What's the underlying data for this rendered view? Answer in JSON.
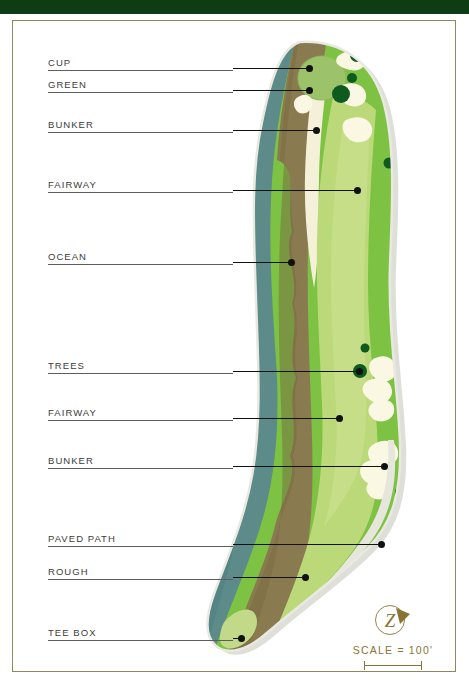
{
  "document": {
    "type": "golf-hole-plan-diagram",
    "header_band_color": "#0e3d13",
    "frame_border_color": "#8a8a5e",
    "background_color": "#ffffff"
  },
  "callouts": [
    {
      "label": "CUP",
      "rule_width": 185,
      "x": 48,
      "y": 68,
      "leader_x": 233,
      "leader_end": 310,
      "leader_y": 68
    },
    {
      "label": "GREEN",
      "rule_width": 185,
      "x": 48,
      "y": 90,
      "leader_x": 233,
      "leader_end": 310,
      "leader_y": 90
    },
    {
      "label": "BUNKER",
      "rule_width": 185,
      "x": 48,
      "y": 130,
      "leader_x": 233,
      "leader_end": 317,
      "leader_y": 130
    },
    {
      "label": "FAIRWAY",
      "rule_width": 185,
      "x": 48,
      "y": 190,
      "leader_x": 233,
      "leader_end": 358,
      "leader_y": 190
    },
    {
      "label": "OCEAN",
      "rule_width": 185,
      "x": 48,
      "y": 262,
      "leader_x": 233,
      "leader_end": 292,
      "leader_y": 262
    },
    {
      "label": "TREES",
      "rule_width": 185,
      "x": 48,
      "y": 371,
      "leader_x": 233,
      "leader_end": 360,
      "leader_y": 371
    },
    {
      "label": "FAIRWAY",
      "rule_width": 185,
      "x": 48,
      "y": 418,
      "leader_x": 233,
      "leader_end": 340,
      "leader_y": 418
    },
    {
      "label": "BUNKER",
      "rule_width": 185,
      "x": 48,
      "y": 466,
      "leader_x": 233,
      "leader_end": 385,
      "leader_y": 466
    },
    {
      "label": "PAVED PATH",
      "rule_width": 185,
      "x": 48,
      "y": 544,
      "leader_x": 233,
      "leader_end": 382,
      "leader_y": 544
    },
    {
      "label": "ROUGH",
      "rule_width": 185,
      "x": 48,
      "y": 577,
      "leader_x": 233,
      "leader_end": 306,
      "leader_y": 577
    },
    {
      "label": "TEE BOX",
      "rule_width": 185,
      "x": 48,
      "y": 638,
      "leader_x": 233,
      "leader_end": 242,
      "leader_y": 638
    }
  ],
  "scale": {
    "text": "SCALE = 100'",
    "logo_letter": "Z",
    "logo_color": "#8a7434",
    "bar_color": "#8a7434"
  },
  "map_colors": {
    "ocean": "#5c8b89",
    "ocean_deep": "#4f7f80",
    "cliff_rough_brown": "#8a7a4f",
    "cliff_rough_dark": "#7a6a42",
    "sand_bunker": "#f4f1d8",
    "bunker_white": "#faf7e2",
    "fairway": "#bcd97a",
    "fairway_light": "#c9e08d",
    "rough_green": "#7dc242",
    "rough_green_dark": "#6cb234",
    "green_putting": "#9cc26a",
    "tree_dark": "#0f5a1e",
    "paved_path": "#e6e6dc",
    "tee_box": "#c3d98a",
    "shadow": "#d9d9d4"
  }
}
